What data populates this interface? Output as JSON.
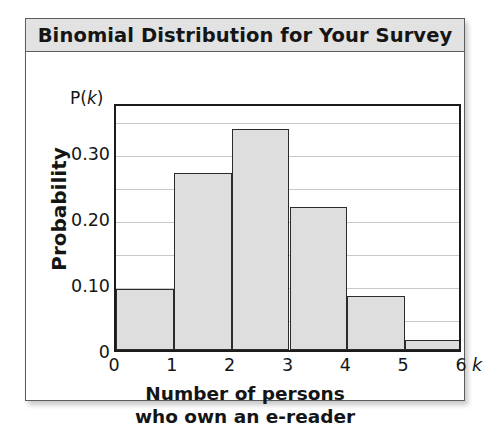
{
  "card": {
    "title": "Binomial Distribution for Your Survey"
  },
  "axis": {
    "y_axis_note": "P(k)",
    "y_axis_note_prefix": "P(",
    "y_axis_note_var": "k",
    "y_axis_note_suffix": ")",
    "y_title": "Probability",
    "x_variable": "k",
    "y_ticks": [
      "0.30",
      "0.20",
      "0.10",
      "0"
    ],
    "x_ticks": [
      "0",
      "1",
      "2",
      "3",
      "4",
      "5",
      "6"
    ]
  },
  "caption": {
    "line1": "Number of persons",
    "line2": "who own an e-reader"
  },
  "colors": {
    "bar_fill": "#dedede",
    "bar_stroke": "#2b2b2b",
    "frame": "#1b1b1b",
    "gridline": "#c9c9c9",
    "title_bar": "#e2e2e2",
    "card_border": "#5d5d5d",
    "text": "#151515"
  },
  "chart_data": {
    "type": "bar",
    "title": "Binomial Distribution for Your Survey",
    "xlabel": "Number of persons who own an e-reader",
    "ylabel": "Probability",
    "x_symbol": "k",
    "y_symbol": "P(k)",
    "categories": [
      "0",
      "1",
      "2",
      "3",
      "4",
      "5"
    ],
    "values": [
      0.093,
      0.267,
      0.334,
      0.216,
      0.082,
      0.015
    ],
    "ylim": [
      0,
      0.375
    ],
    "xlim": [
      0,
      6
    ],
    "y_major_ticks": [
      0,
      0.1,
      0.2,
      0.3
    ],
    "y_major_tick_labels": [
      "0",
      "0.10",
      "0.20",
      "0.30"
    ],
    "y_gridlines": [
      0.05,
      0.1,
      0.15,
      0.2,
      0.25,
      0.3,
      0.35
    ],
    "x_tick_labels": [
      "0",
      "1",
      "2",
      "3",
      "4",
      "5",
      "6"
    ],
    "grid": true,
    "legend": "none",
    "bar_edges": [
      0,
      1,
      2,
      3,
      4,
      5,
      6
    ]
  }
}
